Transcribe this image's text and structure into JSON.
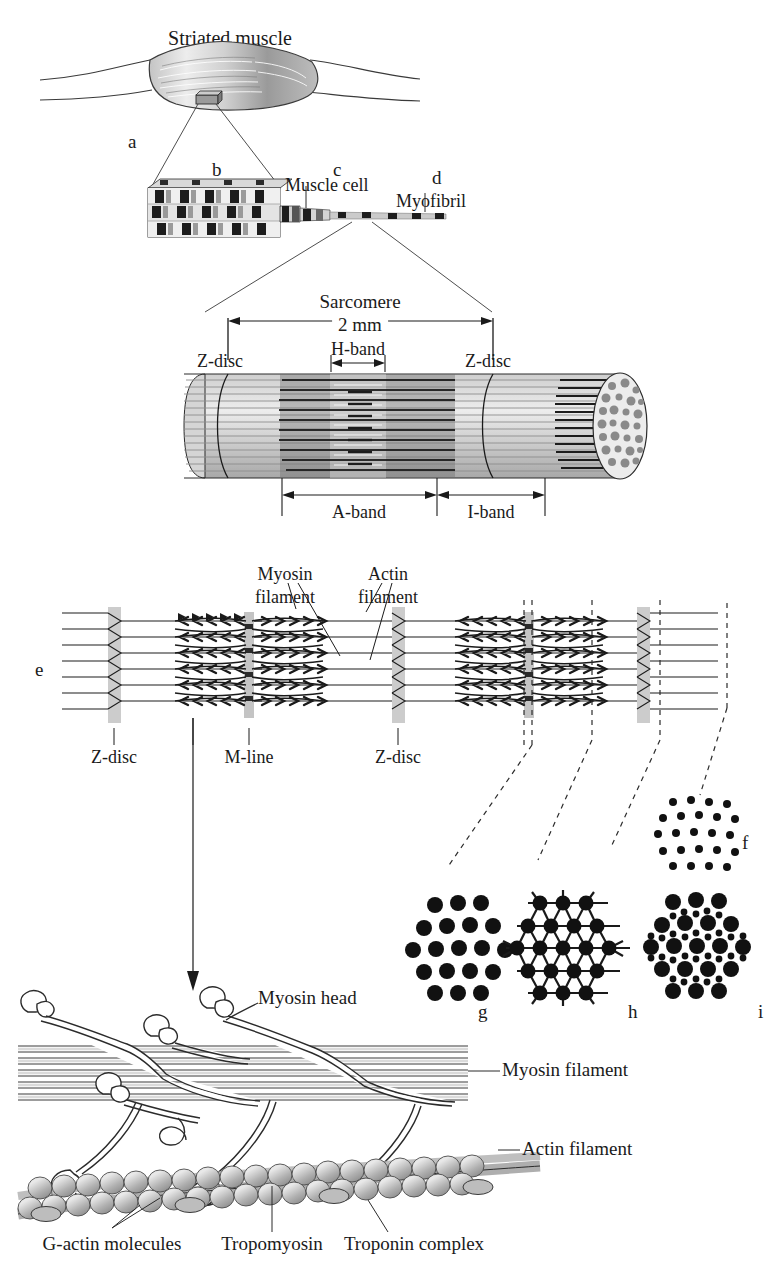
{
  "figure": {
    "title": "Striated muscle",
    "panels": {
      "a": "a",
      "b": "b",
      "c": "c",
      "d": "d",
      "e": "e",
      "f": "f",
      "g": "g",
      "h": "h",
      "i": "i"
    },
    "labels": {
      "muscle_cell": "Muscle cell",
      "myofibril": "Myofibril",
      "sarcomere": "Sarcomere",
      "sarcomere_length": "2 mm",
      "z_disc_left": "Z-disc",
      "z_disc_right": "Z-disc",
      "h_band": "H-band",
      "a_band": "A-band",
      "i_band": "I-band",
      "myosin_filament_callout": "Myosin\nfilament",
      "myosin_filament_line1": "Myosin",
      "myosin_filament_line2": "filament",
      "actin_filament_line1": "Actin",
      "actin_filament_line2": "filament",
      "z_disc_e_left": "Z-disc",
      "m_line": "M-line",
      "z_disc_e_right": "Z-disc",
      "myosin_head": "Myosin head",
      "myosin_filament_right": "Myosin filament",
      "actin_filament_right": "Actin filament",
      "g_actin": "G-actin molecules",
      "tropomyosin": "Tropomyosin",
      "troponin": "Troponin complex"
    },
    "colors": {
      "ink": "#1a1a1a",
      "line": "#2b2b2b",
      "muscle_fill_light": "#d8d8d8",
      "muscle_fill_dark": "#8e8e8e",
      "zdisc_gray": "#c9c9c9",
      "mline_gray": "#bdbdbd",
      "actin_bead": "#a9a9a9",
      "cylinder_light": "#e3e3e3",
      "cylinder_mid": "#b5b5b5",
      "cylinder_dark": "#6f6f6f"
    }
  },
  "cross_sections": {
    "f": {
      "label": "f",
      "description": "actin-only hexagonal array",
      "dot_counts": [
        4,
        5,
        6,
        5,
        4
      ],
      "dot_kind": "small"
    },
    "g": {
      "label": "g",
      "description": "myosin-only hexagonal array",
      "dot_counts": [
        3,
        4,
        5,
        4,
        3
      ],
      "dot_kind": "large"
    },
    "h": {
      "label": "h",
      "description": "myosin array with cross-bridge links",
      "dot_counts": [
        3,
        4,
        5,
        4,
        3
      ],
      "dot_kind": "large-linked"
    },
    "i": {
      "label": "i",
      "description": "myosin with surrounding actin filaments",
      "dot_counts": [
        3,
        4,
        5,
        4,
        3
      ],
      "dot_kind": "mixed"
    }
  }
}
